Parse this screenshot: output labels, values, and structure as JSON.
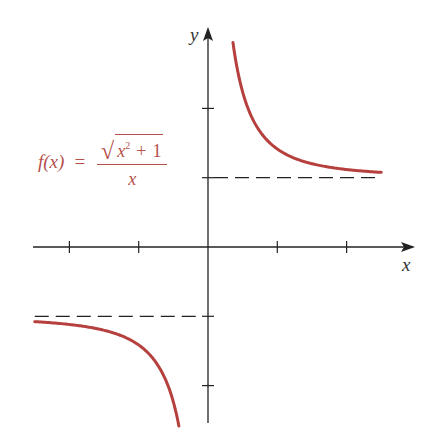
{
  "chart_data": {
    "type": "line",
    "title": "",
    "function_label": {
      "lhs": "f(x)",
      "eq": "=",
      "numerator_radicand_var": "x",
      "numerator_exponent": "2",
      "numerator_op": "+",
      "numerator_const": "1",
      "denominator": "x"
    },
    "xlabel": "x",
    "ylabel": "y",
    "xlim": [
      -2.5,
      2.95
    ],
    "ylim": [
      -2.55,
      3.1
    ],
    "x_ticks": [
      -2,
      -1,
      1,
      2
    ],
    "y_ticks": [
      -2,
      -1,
      1,
      2
    ],
    "tick_labels_shown": false,
    "grid": false,
    "legend": null,
    "series": [
      {
        "name": "f(x) = sqrt(x^2+1)/x, x>0",
        "color": "#b5403e",
        "x": [
          0.36,
          0.5,
          0.75,
          1.0,
          1.25,
          1.5,
          2.0,
          2.5
        ],
        "y": [
          2.95,
          2.24,
          1.67,
          1.41,
          1.28,
          1.2,
          1.12,
          1.08
        ]
      },
      {
        "name": "f(x) = sqrt(x^2+1)/x, x<0",
        "color": "#b5403e",
        "x": [
          -2.5,
          -2.0,
          -1.5,
          -1.25,
          -1.0,
          -0.75,
          -0.5,
          -0.42
        ],
        "y": [
          -1.08,
          -1.12,
          -1.2,
          -1.28,
          -1.41,
          -1.67,
          -2.24,
          -2.57
        ]
      }
    ],
    "asymptotes": [
      {
        "type": "horizontal",
        "y": 1,
        "x_range": [
          0,
          2.5
        ],
        "style": "dashed"
      },
      {
        "type": "horizontal",
        "y": -1,
        "x_range": [
          -2.5,
          0
        ],
        "style": "dashed"
      }
    ],
    "colors": {
      "curve": "#b5403e",
      "axes": "#222222",
      "asymptote": "#222222",
      "formula": "#b5504c"
    }
  }
}
